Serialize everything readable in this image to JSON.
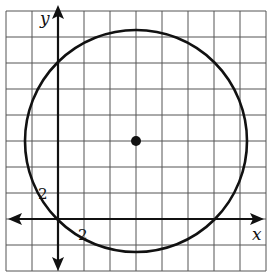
{
  "diagram": {
    "type": "coordinate-plane-circle",
    "axes": {
      "x_label": "x",
      "y_label": "y",
      "x_tick_label": "2",
      "y_tick_label": "2",
      "units_per_grid": 2
    },
    "grid": {
      "cell_px": 26,
      "x_range_units": [
        -4,
        16
      ],
      "y_range_units": [
        -4,
        16
      ]
    },
    "circle": {
      "center": [
        6,
        6
      ],
      "passes_through": [
        0,
        0
      ],
      "radius_units": 8.49,
      "center_marked": true
    },
    "colors": {
      "grid": "#555555",
      "axis": "#111111",
      "circle": "#111111",
      "background": "#ffffff"
    }
  }
}
